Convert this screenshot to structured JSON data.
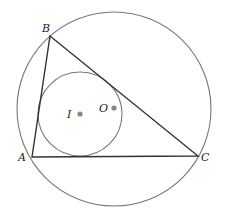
{
  "diagram": {
    "type": "geometry",
    "colors": {
      "background": "#ffffff",
      "triangle_stroke": "#333333",
      "circle_stroke": "#777777",
      "point_fill": "#888888",
      "label": "#222222"
    },
    "circumcircle": {
      "cx": 114,
      "cy": 109,
      "r": 97
    },
    "incircle": {
      "cx": 80,
      "cy": 114,
      "r": 42
    },
    "vertices": [
      {
        "name": "A",
        "x": 32,
        "y": 157,
        "label": "A",
        "label_x": 18,
        "label_y": 161
      },
      {
        "name": "B",
        "x": 50,
        "y": 36,
        "label": "B",
        "label_x": 42,
        "label_y": 32
      },
      {
        "name": "C",
        "x": 198,
        "y": 156,
        "label": "C",
        "label_x": 201,
        "label_y": 161
      }
    ],
    "points": [
      {
        "name": "I",
        "x": 80,
        "y": 114,
        "label": "I",
        "label_x": 67,
        "label_y": 118
      },
      {
        "name": "O",
        "x": 114,
        "y": 108,
        "label": "O",
        "label_x": 99,
        "label_y": 112
      }
    ]
  }
}
